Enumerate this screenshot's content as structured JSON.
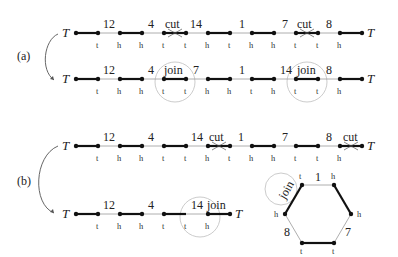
{
  "panels": [
    {
      "label": "(a)",
      "italic_part": "a"
    },
    {
      "label": "(b)",
      "italic_part": "b"
    }
  ],
  "telomere_symbol": "T",
  "operations": {
    "cut": "cut",
    "join": "join"
  },
  "rows": [
    {
      "id": "a-before",
      "genes": [
        "12",
        "4",
        "cut",
        "14",
        "1",
        "7",
        "cut",
        "8"
      ],
      "ends": [
        "t",
        "h",
        "h",
        "t",
        "t",
        "h",
        "t",
        "h",
        "h",
        "t",
        "t",
        "h"
      ]
    },
    {
      "id": "a-after",
      "genes": [
        "12",
        "4",
        "join",
        "7",
        "1",
        "14",
        "join",
        "8"
      ],
      "ends": [
        "t",
        "h",
        "h",
        "t",
        "t",
        "h",
        "h",
        "t",
        "h",
        "t",
        "t",
        "h"
      ]
    },
    {
      "id": "b-before",
      "genes": [
        "12",
        "4",
        "14",
        "cut",
        "1",
        "7",
        "8",
        "cut"
      ],
      "ends": [
        "t",
        "h",
        "h",
        "t",
        "t",
        "h",
        "t",
        "h",
        "h",
        "t",
        "t",
        "h"
      ]
    },
    {
      "id": "b-after-linear",
      "genes": [
        "12",
        "4",
        "14",
        "join"
      ],
      "ends": [
        "t",
        "h",
        "h",
        "t",
        "t",
        "h"
      ]
    }
  ],
  "circular_chromosome": {
    "labels": {
      "top": "1",
      "bottom_left": "8",
      "bottom_right": "7",
      "join": "join"
    },
    "vertex_ends": {
      "top_left": "t",
      "top_right": "h",
      "right": "h",
      "bottom_right": "t",
      "bottom_left": "t",
      "left": "h"
    }
  }
}
